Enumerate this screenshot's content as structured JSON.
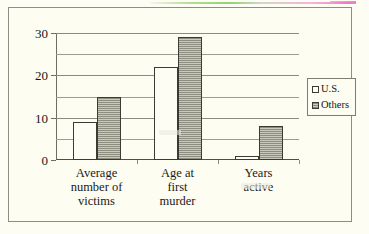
{
  "chart_data": {
    "type": "bar",
    "title": "",
    "subtitle": "",
    "xlabel": "",
    "ylabel": "",
    "categories": [
      "Average\nnumber of\nvictims",
      "Age at\nfirst\nmurder",
      "Years\nactive"
    ],
    "category_lines": [
      [
        "Average",
        "number of",
        "victims"
      ],
      [
        "Age at",
        "first",
        "murder"
      ],
      [
        "Years",
        "active"
      ]
    ],
    "series": [
      {
        "name": "U.S.",
        "values": [
          9,
          22,
          1
        ],
        "color": "#fdfdf3",
        "pattern": "solid-white"
      },
      {
        "name": "Others",
        "values": [
          15,
          29,
          8
        ],
        "color": "#8d8d80",
        "pattern": "horizontal-hatch-gray"
      }
    ],
    "ylim": [
      0,
      30
    ],
    "yticks": [
      0,
      10,
      20,
      30
    ],
    "ytick_labels": [
      "0",
      "10",
      "20",
      "30"
    ],
    "yminor_ticks": [
      5,
      15,
      25
    ],
    "grid": true,
    "grid_axis": "y",
    "legend_position": "right",
    "legend_entries": [
      "U.S.",
      "Others"
    ],
    "annotations": []
  },
  "legend": {
    "entries": [
      {
        "label": "U.S."
      },
      {
        "label": "Others"
      }
    ]
  },
  "axis": {
    "y_labels": [
      "30",
      "20",
      "10",
      "0"
    ]
  },
  "colors": {
    "page_background": "#fdfdf3",
    "frame_border": "#8e8e80",
    "gridline": "#8b8b7d",
    "bar_outline": "#3b3b33",
    "series_us": "#fdfdf3",
    "series_others": "#8d8d80",
    "text": "#161616"
  }
}
